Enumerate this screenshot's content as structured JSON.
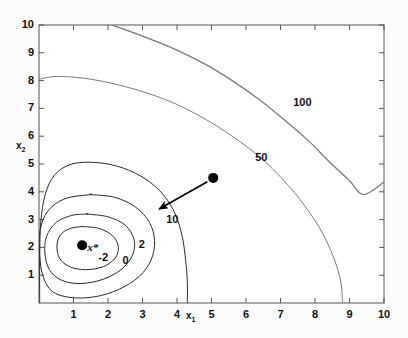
{
  "chart_data": {
    "type": "line",
    "title": "",
    "subtitle": "",
    "xlabel": "x1",
    "ylabel": "x2",
    "xlim": [
      0,
      10
    ],
    "ylim": [
      0,
      10
    ],
    "grid": false,
    "legend_position": "none",
    "x_ticks": [
      "1",
      "2",
      "3",
      "4",
      "5",
      "6",
      "7",
      "8",
      "9",
      "10"
    ],
    "x_tick_values": [
      1,
      2,
      3,
      4,
      5,
      6,
      7,
      8,
      9,
      10
    ],
    "y_ticks": [
      "1",
      "2",
      "3",
      "4",
      "5",
      "6",
      "7",
      "8",
      "9",
      "10"
    ],
    "y_tick_values": [
      1,
      2,
      3,
      4,
      5,
      6,
      7,
      8,
      9,
      10
    ],
    "contour_levels": [
      -2,
      0,
      2,
      10,
      50,
      100
    ],
    "contour_labels": [
      {
        "level": "-2",
        "x": 1.95,
        "y": 1.62
      },
      {
        "level": "0",
        "x": 2.65,
        "y": 1.5
      },
      {
        "level": "2",
        "x": 3.12,
        "y": 2.1
      },
      {
        "level": "10",
        "x": 3.92,
        "y": 3.0
      },
      {
        "level": "50",
        "x": 6.5,
        "y": 5.2
      },
      {
        "level": "100",
        "x": 7.6,
        "y": 7.2
      }
    ],
    "points": [
      {
        "name": "minimizer",
        "label": "x*",
        "x": 1.25,
        "y": 2.08
      },
      {
        "name": "start-point",
        "label": "",
        "x": 5.05,
        "y": 4.5
      }
    ],
    "arrow": {
      "from_x": 4.88,
      "from_y": 4.36,
      "to_x": 3.48,
      "to_y": 3.38
    },
    "series": [
      {
        "name": "contour--2",
        "level": -2,
        "closed": true,
        "points": [
          [
            1.25,
            2.75
          ],
          [
            1.75,
            2.68
          ],
          [
            2.15,
            2.4
          ],
          [
            2.3,
            2.0
          ],
          [
            2.2,
            1.6
          ],
          [
            1.85,
            1.3
          ],
          [
            1.35,
            1.2
          ],
          [
            0.9,
            1.3
          ],
          [
            0.6,
            1.6
          ],
          [
            0.52,
            2.05
          ],
          [
            0.62,
            2.45
          ],
          [
            0.9,
            2.68
          ],
          [
            1.25,
            2.75
          ]
        ]
      },
      {
        "name": "contour-0",
        "level": 0,
        "closed": true,
        "points": [
          [
            1.4,
            3.2
          ],
          [
            2.0,
            3.1
          ],
          [
            2.5,
            2.8
          ],
          [
            2.75,
            2.3
          ],
          [
            2.72,
            1.75
          ],
          [
            2.4,
            1.22
          ],
          [
            1.85,
            0.85
          ],
          [
            1.2,
            0.7
          ],
          [
            0.65,
            0.82
          ],
          [
            0.3,
            1.2
          ],
          [
            0.17,
            1.8
          ],
          [
            0.22,
            2.4
          ],
          [
            0.5,
            2.9
          ],
          [
            0.95,
            3.15
          ],
          [
            1.4,
            3.2
          ]
        ]
      },
      {
        "name": "contour-2",
        "level": 2,
        "closed": true,
        "points": [
          [
            1.5,
            3.9
          ],
          [
            2.2,
            3.8
          ],
          [
            2.8,
            3.45
          ],
          [
            3.2,
            2.9
          ],
          [
            3.35,
            2.25
          ],
          [
            3.25,
            1.55
          ],
          [
            2.9,
            0.95
          ],
          [
            2.3,
            0.48
          ],
          [
            1.6,
            0.22
          ],
          [
            0.9,
            0.2
          ],
          [
            0.38,
            0.42
          ],
          [
            0.12,
            0.95
          ],
          [
            0.02,
            1.7
          ],
          [
            0.03,
            2.6
          ],
          [
            0.25,
            3.3
          ],
          [
            0.75,
            3.75
          ],
          [
            1.5,
            3.9
          ]
        ]
      },
      {
        "name": "contour-10",
        "level": 10,
        "closed": false,
        "points": [
          [
            0.02,
            0.0
          ],
          [
            0.02,
            1.6
          ],
          [
            0.05,
            2.9
          ],
          [
            0.18,
            3.9
          ],
          [
            0.45,
            4.6
          ],
          [
            0.95,
            5.0
          ],
          [
            1.7,
            5.05
          ],
          [
            2.45,
            4.85
          ],
          [
            3.1,
            4.45
          ],
          [
            3.6,
            3.9
          ],
          [
            3.95,
            3.2
          ],
          [
            4.15,
            2.4
          ],
          [
            4.25,
            1.55
          ],
          [
            4.3,
            0.75
          ],
          [
            4.3,
            0.0
          ]
        ]
      },
      {
        "name": "contour-50",
        "level": 50,
        "closed": false,
        "points": [
          [
            0.0,
            8.05
          ],
          [
            0.55,
            8.15
          ],
          [
            1.5,
            8.05
          ],
          [
            2.6,
            7.75
          ],
          [
            3.7,
            7.3
          ],
          [
            4.7,
            6.7
          ],
          [
            5.6,
            6.0
          ],
          [
            6.4,
            5.25
          ],
          [
            7.1,
            4.4
          ],
          [
            7.7,
            3.5
          ],
          [
            8.2,
            2.55
          ],
          [
            8.55,
            1.6
          ],
          [
            8.75,
            0.75
          ],
          [
            8.8,
            0.0
          ]
        ]
      },
      {
        "name": "contour-100",
        "level": 100,
        "closed": false,
        "points": [
          [
            2.1,
            10.0
          ],
          [
            3.0,
            9.6
          ],
          [
            3.9,
            9.15
          ],
          [
            4.8,
            8.6
          ],
          [
            5.6,
            8.0
          ],
          [
            6.4,
            7.3
          ],
          [
            7.1,
            6.6
          ],
          [
            7.8,
            5.85
          ],
          [
            8.4,
            5.1
          ],
          [
            9.0,
            4.4
          ],
          [
            9.4,
            3.9
          ],
          [
            10.0,
            4.35
          ]
        ]
      }
    ]
  },
  "axes": {
    "x_axis_title": "x",
    "x_axis_sub": "1",
    "y_axis_title": "x",
    "y_axis_sub": "2"
  },
  "colors": {
    "contour_dark": "#2a2a2a",
    "contour_light": "#7a7a7a",
    "axis": "#555555",
    "text": "#111111",
    "background": "#fbfbfb",
    "point": "#000000"
  }
}
